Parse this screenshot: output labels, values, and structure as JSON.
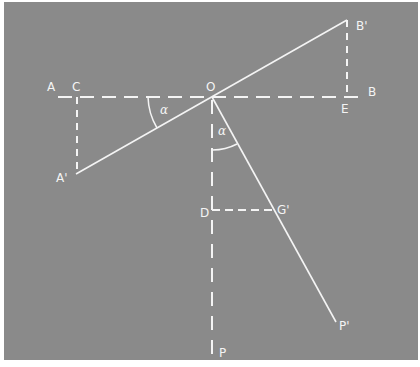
{
  "diagram": {
    "background": "#8a8a8a",
    "line_color": "#f4f4f4",
    "points": {
      "A": {
        "label": "A",
        "x": 50,
        "y": 92
      },
      "C": {
        "label": "C",
        "x": 76,
        "y": 92
      },
      "O": {
        "label": "O",
        "x": 212,
        "y": 92
      },
      "E": {
        "label": "E",
        "x": 346,
        "y": 112
      },
      "B": {
        "label": "B",
        "x": 372,
        "y": 92
      },
      "B_prime": {
        "label": "B'",
        "x": 356,
        "y": 22
      },
      "A_prime": {
        "label": "A'",
        "x": 62,
        "y": 178
      },
      "D": {
        "label": "D",
        "x": 203,
        "y": 215
      },
      "G_prime": {
        "label": "G'",
        "x": 278,
        "y": 213
      },
      "P_prime": {
        "label": "P'",
        "x": 339,
        "y": 327
      },
      "P": {
        "label": "P",
        "x": 222,
        "y": 352
      }
    },
    "angle_labels": [
      {
        "label": "α",
        "x": 162,
        "y": 110
      },
      {
        "label": "α",
        "x": 222,
        "y": 134
      }
    ],
    "title": ""
  }
}
